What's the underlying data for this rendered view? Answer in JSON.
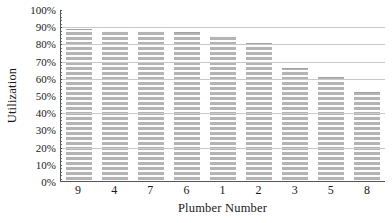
{
  "chart_data": {
    "type": "bar",
    "title": "",
    "subtitle": "",
    "xlabel": "Plumber Number",
    "ylabel": "Utilization",
    "categories": [
      "9",
      "4",
      "7",
      "6",
      "1",
      "2",
      "3",
      "5",
      "8"
    ],
    "values": [
      89,
      88,
      88,
      87,
      85,
      81,
      66,
      61,
      52
    ],
    "series": [
      {
        "name": "Utilization",
        "values": [
          89,
          88,
          88,
          87,
          85,
          81,
          66,
          61,
          52
        ]
      }
    ],
    "ylim": [
      0,
      100
    ],
    "y_tick_values": [
      0,
      10,
      20,
      30,
      40,
      50,
      60,
      70,
      80,
      90,
      100
    ],
    "y_tick_labels": [
      "0%",
      "10%",
      "20%",
      "30%",
      "40%",
      "50%",
      "60%",
      "70%",
      "80%",
      "90%",
      "100%"
    ],
    "y_unit": "%",
    "grid": true,
    "grid_orientation": "horizontal",
    "legend": false,
    "legend_position": "none",
    "bar_color": "#b4b4b4",
    "axis_color": "#555555",
    "gridline_color": "#ffffff",
    "background_color": "#ffffff",
    "annotations": []
  }
}
